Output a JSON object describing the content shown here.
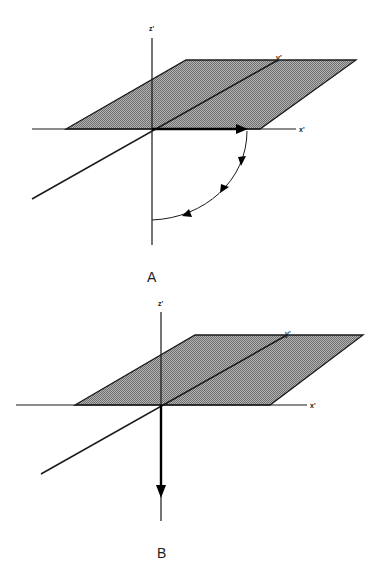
{
  "figure": {
    "panels": [
      {
        "id": "A",
        "caption": "A",
        "axes": {
          "x": "x'",
          "y": "y'",
          "z": "z'"
        },
        "description": "Shaded x'y' plane with vector along +x' rotating by a 90° arc (three arrowheads) down toward -z'"
      },
      {
        "id": "B",
        "caption": "B",
        "axes": {
          "x": "x'",
          "y": "y'",
          "z": "z'"
        },
        "description": "Shaded x'y' plane with vector pointing along -z' after rotation"
      }
    ],
    "colors": {
      "line": "#1a1a1a",
      "plane_fill": "#9a9a9a",
      "background": "#ffffff"
    }
  }
}
